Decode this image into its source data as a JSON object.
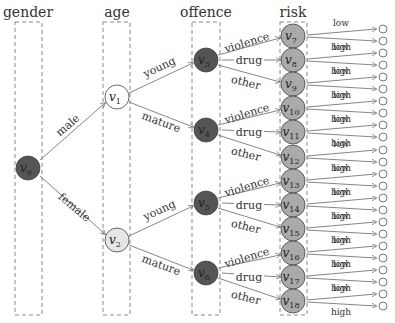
{
  "columns": [
    {
      "id": "gender",
      "label": "gender"
    },
    {
      "id": "age",
      "label": "age"
    },
    {
      "id": "offence",
      "label": "offence"
    },
    {
      "id": "risk",
      "label": "risk"
    }
  ],
  "nodes": {
    "v0": {
      "label": "v0",
      "fill": "#555555"
    },
    "v1": {
      "label": "v1",
      "fill": "#ffffff"
    },
    "v2": {
      "label": "v2",
      "fill": "#e6e6e6"
    },
    "v3": {
      "label": "v3",
      "fill": "#555555"
    },
    "v4": {
      "label": "v4",
      "fill": "#555555"
    },
    "v5": {
      "label": "v5",
      "fill": "#555555"
    },
    "v6": {
      "label": "v6",
      "fill": "#555555"
    },
    "risk": [
      "v7",
      "v8",
      "v9",
      "v10",
      "v11",
      "v12",
      "v13",
      "v14",
      "v15",
      "v16",
      "v17",
      "v18"
    ]
  },
  "edges": {
    "gender": {
      "male": "male",
      "female": "female"
    },
    "age": {
      "young": "young",
      "mature": "mature"
    },
    "offence": {
      "violence": "violence",
      "drug": "drug",
      "other": "other"
    },
    "risk": {
      "low": "low",
      "high": "high"
    }
  },
  "colors": {
    "dark_node": "#555555",
    "risk_node": "#aaaaaa",
    "light_node": "#e6e6e6",
    "edge": "#777777",
    "box": "#888888"
  }
}
